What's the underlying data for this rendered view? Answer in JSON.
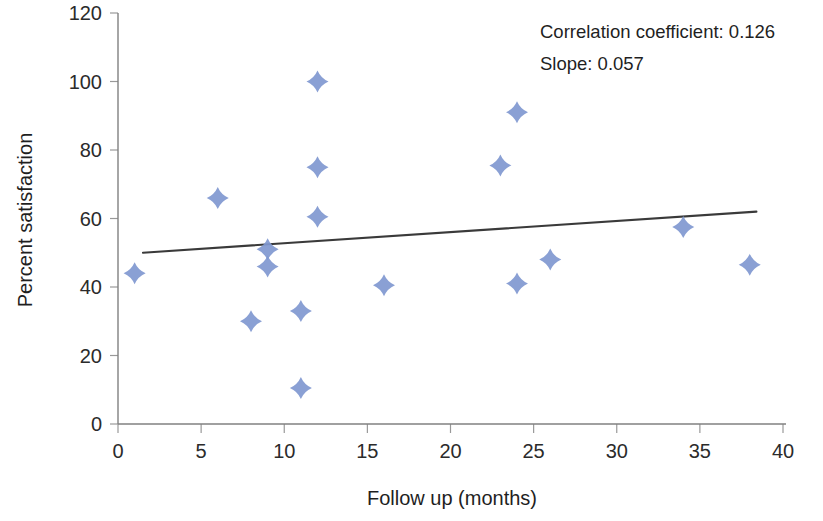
{
  "chart_data": {
    "type": "scatter",
    "title": "",
    "xlabel": "Follow up (months)",
    "ylabel": "Percent satisfaction",
    "xlim": [
      0,
      40
    ],
    "ylim": [
      0,
      120
    ],
    "x_ticks": [
      0,
      5,
      10,
      15,
      20,
      25,
      30,
      35,
      40
    ],
    "y_ticks": [
      0,
      20,
      40,
      60,
      80,
      100,
      120
    ],
    "grid": false,
    "legend": null,
    "marker_shape": "diamond",
    "marker_color": "#8098d0",
    "series": [
      {
        "name": "Patients",
        "points": [
          {
            "x": 1,
            "y": 44
          },
          {
            "x": 6,
            "y": 66
          },
          {
            "x": 8,
            "y": 30
          },
          {
            "x": 9,
            "y": 51
          },
          {
            "x": 9,
            "y": 46
          },
          {
            "x": 11,
            "y": 33
          },
          {
            "x": 11,
            "y": 10.5
          },
          {
            "x": 12,
            "y": 100
          },
          {
            "x": 12,
            "y": 75
          },
          {
            "x": 12,
            "y": 60.5
          },
          {
            "x": 16,
            "y": 40.5
          },
          {
            "x": 23,
            "y": 75.5
          },
          {
            "x": 24,
            "y": 91
          },
          {
            "x": 24,
            "y": 41
          },
          {
            "x": 26,
            "y": 48
          },
          {
            "x": 34,
            "y": 57.5
          },
          {
            "x": 38,
            "y": 46.5
          }
        ]
      }
    ],
    "trendline": {
      "type": "linear",
      "color": "#3a3a3a",
      "x_start": 1.5,
      "y_start": 50.0,
      "x_end": 38.4,
      "y_end": 62.0
    },
    "annotations": [
      {
        "name": "correlation-coefficient",
        "label": "Correlation coefficient:",
        "value": "0.126",
        "text": "Correlation coefficient:  0.126"
      },
      {
        "name": "slope",
        "label": "Slope:",
        "value": "0.057",
        "text": "Slope:  0.057"
      }
    ]
  }
}
